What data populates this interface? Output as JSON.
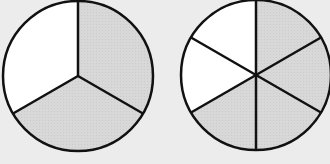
{
  "colors": {
    "background": "#ececec",
    "shaded": "#d6d6d6",
    "unshaded": "#ffffff",
    "stroke": "#111111"
  },
  "figures": [
    {
      "name": "thirds-circle",
      "parts": 3,
      "shaded": 2,
      "fraction": "2/3"
    },
    {
      "name": "sixths-circle",
      "parts": 6,
      "shaded": 4,
      "fraction": "4/6"
    }
  ]
}
